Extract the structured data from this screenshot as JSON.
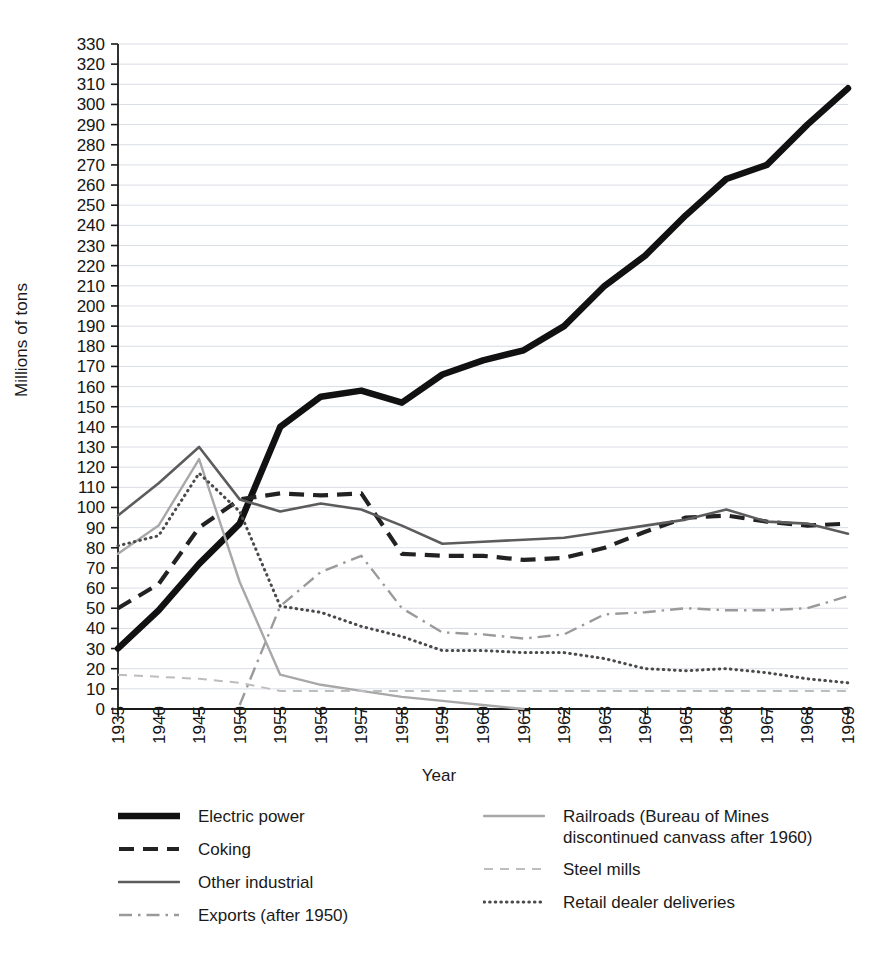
{
  "chart_data": {
    "type": "line",
    "title": "",
    "xlabel": "Year",
    "ylabel": "Millions of tons",
    "ylim": [
      0,
      330
    ],
    "ytick_step": 10,
    "grid": true,
    "legend_position": "bottom",
    "categories": [
      "1935",
      "1940",
      "1945",
      "1950",
      "1955",
      "1956",
      "1957",
      "1958",
      "1959",
      "1960",
      "1961",
      "1962",
      "1963",
      "1964",
      "1965",
      "1966",
      "1967",
      "1968",
      "1969"
    ],
    "yticks": [
      "0",
      "10",
      "20",
      "30",
      "40",
      "50",
      "60",
      "70",
      "80",
      "90",
      "100",
      "110",
      "120",
      "130",
      "140",
      "150",
      "160",
      "170",
      "180",
      "190",
      "200",
      "210",
      "220",
      "230",
      "240",
      "250",
      "260",
      "270",
      "280",
      "290",
      "300",
      "310",
      "320",
      "330"
    ],
    "series": [
      {
        "name": "Electric power",
        "style": "solid-thick",
        "color": "#111111",
        "values": [
          30,
          49,
          72,
          92,
          140,
          155,
          158,
          152,
          166,
          173,
          178,
          190,
          210,
          225,
          245,
          263,
          270,
          290,
          308
        ]
      },
      {
        "name": "Coking",
        "style": "dashed",
        "color": "#222222",
        "values": [
          50,
          62,
          90,
          104,
          107,
          106,
          107,
          77,
          76,
          76,
          74,
          75,
          80,
          88,
          95,
          96,
          93,
          91,
          92
        ]
      },
      {
        "name": "Other industrial",
        "style": "solid",
        "color": "#5c5c5c",
        "values": [
          96,
          112,
          130,
          104,
          98,
          102,
          99,
          91,
          82,
          83,
          84,
          85,
          88,
          91,
          94,
          99,
          93,
          92,
          87
        ]
      },
      {
        "name": "Exports (after 1950)",
        "style": "dash-dot",
        "color": "#9a9a9a",
        "values": [
          null,
          null,
          null,
          2,
          51,
          68,
          76,
          50,
          38,
          37,
          35,
          37,
          47,
          48,
          50,
          49,
          49,
          50,
          56
        ]
      },
      {
        "name": "Railroads (Bureau of Mines\ndiscontinued canvass after 1960)",
        "style": "solid-light",
        "color": "#a8a8a8",
        "values": [
          77,
          91,
          124,
          63,
          17,
          12,
          9,
          6,
          4,
          2,
          0,
          null,
          null,
          null,
          null,
          null,
          null,
          null,
          null
        ]
      },
      {
        "name": "Steel mills",
        "style": "dashed-light",
        "color": "#bdbdbd",
        "values": [
          17,
          16,
          15,
          13,
          9,
          9,
          9,
          9,
          9,
          9,
          9,
          9,
          9,
          9,
          9,
          9,
          9,
          9,
          9
        ]
      },
      {
        "name": "Retail dealer deliveries",
        "style": "dotted",
        "color": "#4a4a4a",
        "values": [
          81,
          86,
          117,
          98,
          51,
          48,
          41,
          36,
          29,
          29,
          28,
          28,
          25,
          20,
          19,
          20,
          18,
          15,
          13
        ]
      }
    ]
  },
  "legend": {
    "column1": [
      {
        "label": "Electric power",
        "style": "solid-thick"
      },
      {
        "label": "Coking",
        "style": "dashed"
      },
      {
        "label": "Other industrial",
        "style": "solid"
      },
      {
        "label": "Exports (after 1950)",
        "style": "dash-dot"
      }
    ],
    "column2": [
      {
        "label": "Railroads (Bureau of Mines\ndiscontinued canvass after 1960)",
        "style": "solid-light"
      },
      {
        "label": "Steel mills",
        "style": "dashed-light"
      },
      {
        "label": "Retail dealer deliveries",
        "style": "dotted"
      }
    ]
  }
}
